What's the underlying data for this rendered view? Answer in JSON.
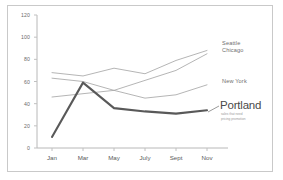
{
  "chart_data": {
    "type": "line",
    "title": "",
    "subtitle": "",
    "xlabel": "",
    "ylabel": "",
    "categories": [
      "Jan",
      "Mar",
      "May",
      "July",
      "Sept",
      "Nov"
    ],
    "ylim": [
      0,
      120
    ],
    "yticks": [
      0,
      20,
      40,
      60,
      80,
      100,
      120
    ],
    "grid": false,
    "legend_position": "inline-right",
    "series": [
      {
        "name": "Seattle",
        "values": [
          68,
          65,
          72,
          67,
          79,
          88
        ],
        "color": "#a8a8a8",
        "highlight": false
      },
      {
        "name": "Chicago",
        "values": [
          63,
          60,
          52,
          61,
          70,
          85
        ],
        "color": "#a8a8a8",
        "highlight": false
      },
      {
        "name": "New York",
        "values": [
          46,
          49,
          52,
          45,
          48,
          57
        ],
        "color": "#a8a8a8",
        "highlight": false
      },
      {
        "name": "Portland",
        "values": [
          10,
          59,
          36,
          33,
          31,
          34
        ],
        "color": "#595959",
        "highlight": true
      }
    ],
    "annotations": {
      "portland_note_line1": "sales that need",
      "portland_note_line2": "pricing promotion"
    },
    "axis_color": "#b5b5b5",
    "tick_label_color": "#6b6b6b",
    "frame_color": "#c9c9c9",
    "background": "#ffffff"
  }
}
